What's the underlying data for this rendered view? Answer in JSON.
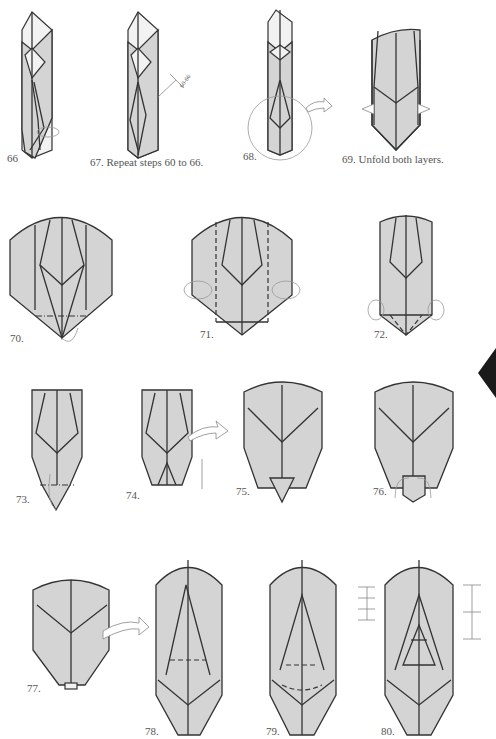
{
  "page": {
    "type": "origami-diagram-sequence",
    "steps": [
      {
        "number": 66,
        "label": "66"
      },
      {
        "number": 67,
        "label": "67. Repeat steps 60 to 66.",
        "callout": "60-66"
      },
      {
        "number": 68,
        "label": "68."
      },
      {
        "number": 69,
        "label": "69. Unfold both layers."
      },
      {
        "number": 70,
        "label": "70."
      },
      {
        "number": 71,
        "label": "71."
      },
      {
        "number": 72,
        "label": "72."
      },
      {
        "number": 73,
        "label": "73."
      },
      {
        "number": 74,
        "label": "74."
      },
      {
        "number": 75,
        "label": "75."
      },
      {
        "number": 76,
        "label": "76."
      },
      {
        "number": 77,
        "label": "77."
      },
      {
        "number": 78,
        "label": "78."
      },
      {
        "number": 79,
        "label": "79."
      },
      {
        "number": 80,
        "label": "80."
      }
    ],
    "colors": {
      "paper": "#d4d4d4",
      "line": "#333333",
      "edge_tab": "#1a1a1a"
    }
  }
}
